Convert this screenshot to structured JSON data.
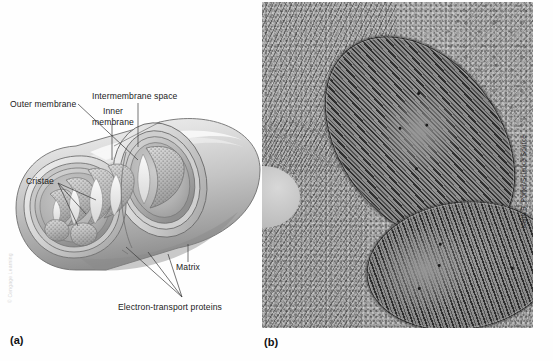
{
  "figure": {
    "background_color": "#fefefe"
  },
  "panel_a": {
    "tag": "(a)",
    "tag_name": "panel-a-label",
    "type": "illustration",
    "subject": "cutaway diagram of a mitochondrion",
    "credit": "© Cengage Learning",
    "labels": [
      {
        "id": "outer-membrane",
        "text": "Outer membrane"
      },
      {
        "id": "intermembrane-space",
        "text": "Intermembrane space"
      },
      {
        "id": "inner-membrane",
        "text": "Inner\nmembrane"
      },
      {
        "id": "inner-membrane-line1",
        "text": "Inner"
      },
      {
        "id": "inner-membrane-line2",
        "text": "membrane"
      },
      {
        "id": "cristae",
        "text": "Cristae"
      },
      {
        "id": "matrix",
        "text": "Matrix"
      },
      {
        "id": "electron-transport-proteins",
        "text": "Electron-transport proteins"
      }
    ],
    "structure_colors": {
      "outer_membrane": "#cfcfcf",
      "inner_membrane": "#b4b4b4",
      "matrix": "#a9a9a9",
      "cristae_fill": "#bdbdbd",
      "outline": "#4a4a4a"
    }
  },
  "panel_b": {
    "tag": "(b)",
    "tag_name": "panel-b-label",
    "type": "transmission electron micrograph",
    "subject": "two mitochondria surrounded by endoplasmic reticulum",
    "credit": "Keith R. Porter/Science Source",
    "mitochondria_count": 2,
    "image_colors": {
      "background": "#a3a3a3",
      "cristae": "#242424",
      "matrix": "#8f8f8f"
    }
  }
}
